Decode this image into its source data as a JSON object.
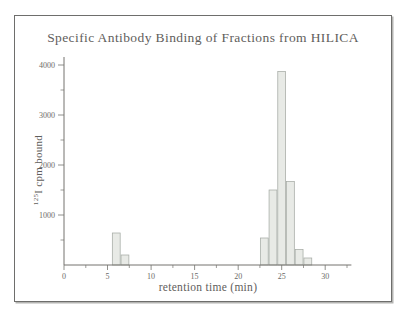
{
  "chart_data": {
    "type": "bar",
    "title": "Specific Antibody Binding of Fractions from HILICA",
    "xlabel": "retention time (min)",
    "ylabel": "125I cpm bound",
    "ylabel_superscript": "125",
    "ylabel_text": "I cpm bound",
    "x": [
      6,
      7,
      23,
      24,
      25,
      26,
      27,
      28
    ],
    "values": [
      640,
      200,
      540,
      1500,
      3870,
      1670,
      310,
      140
    ],
    "bar_width_min": 0.9,
    "xlim": [
      0,
      33
    ],
    "ylim": [
      0,
      4160
    ],
    "x_major_ticks": [
      0,
      5,
      10,
      15,
      20,
      25,
      30
    ],
    "x_minor_ticks": [
      2.5,
      7.5,
      12.5,
      17.5,
      22.5,
      27.5,
      32.5
    ],
    "y_major_ticks": [
      1000,
      2000,
      3000,
      4000
    ],
    "y_minor_ticks": [
      500,
      1500,
      2500,
      3500
    ],
    "grid": false,
    "legend": null,
    "colors": {
      "bar_fill": "#e8eae6",
      "bar_stroke": "#a6aba5",
      "axis": "#74736f",
      "tick_text": "#6b6a66",
      "frame_border": "#6e6e6c"
    }
  }
}
